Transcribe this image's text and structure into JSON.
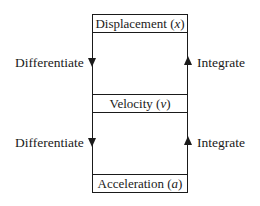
{
  "diagram": {
    "quantities": [
      {
        "name": "Displacement",
        "symbol": "x"
      },
      {
        "name": "Velocity",
        "symbol": "v"
      },
      {
        "name": "Acceleration",
        "symbol": "a"
      }
    ],
    "left_labels": [
      "Differentiate",
      "Differentiate"
    ],
    "right_labels": [
      "Integrate",
      "Integrate"
    ],
    "left_direction": "down",
    "right_direction": "up"
  }
}
